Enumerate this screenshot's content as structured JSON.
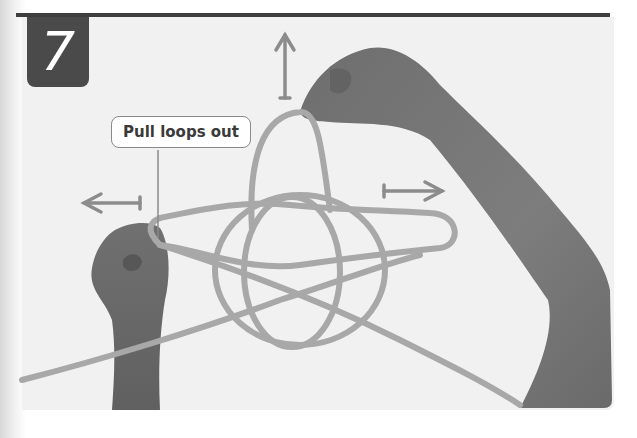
{
  "step": {
    "number": "7",
    "badge_color": "#4a4a4a"
  },
  "callout": {
    "label": "Pull loops out"
  },
  "illustration": {
    "subject": "hands pulling loops of a rope knot",
    "arrows": [
      {
        "direction": "up",
        "icon": "arrow-up-icon"
      },
      {
        "direction": "left",
        "icon": "arrow-left-icon"
      },
      {
        "direction": "right",
        "icon": "arrow-right-icon"
      }
    ],
    "colors": {
      "rule": "#3e3e3e",
      "photo_bg": "#f1f1f1",
      "rope": "#a8a8a8",
      "skin": "#7a7a7a",
      "arrow": "#8c8c8c"
    }
  }
}
